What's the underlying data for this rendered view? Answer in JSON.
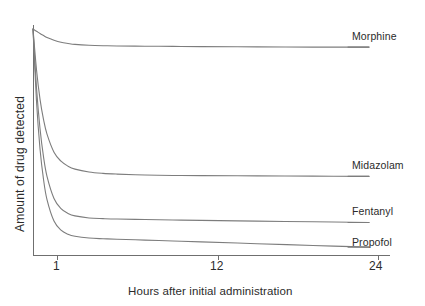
{
  "chart_data": {
    "type": "line",
    "title": "",
    "subtitle": "",
    "xlabel": "Hours after initial administration",
    "ylabel": "Amount of drug detected",
    "x_tick_labels": [
      "1",
      "12",
      "24"
    ],
    "x_tick_values": [
      1,
      12,
      24
    ],
    "y_tick_labels": [],
    "xlim": [
      0,
      25.5
    ],
    "ylim": [
      0,
      100
    ],
    "grid": false,
    "legend_position": "right-inline-end-of-line",
    "note": "Schematic pharmacokinetic decay curves; y-axis is unlabeled/relative amount of drug detected.",
    "series": [
      {
        "name": "Morphine",
        "color": "#7d7d7d",
        "plateau_value": 92,
        "x": [
          0.0,
          0.25,
          0.5,
          0.75,
          1.0,
          1.5,
          2.0,
          2.5,
          3.0,
          4.0,
          5.0,
          6.0,
          8.0,
          10.0,
          12.0,
          16.0,
          20.0,
          24.0
        ],
        "y": [
          100.0,
          99.0,
          98.0,
          97.1,
          96.2,
          95.0,
          94.1,
          93.6,
          93.2,
          92.8,
          92.6,
          92.5,
          92.4,
          92.3,
          92.2,
          92.1,
          92.0,
          92.0
        ]
      },
      {
        "name": "Midazolam",
        "color": "#7d7d7d",
        "plateau_value": 35,
        "x": [
          0.0,
          0.25,
          0.5,
          0.75,
          1.0,
          1.5,
          2.0,
          2.5,
          3.0,
          4.0,
          5.0,
          6.0,
          8.0,
          10.0,
          12.0,
          16.0,
          20.0,
          24.0
        ],
        "y": [
          100.0,
          82.0,
          69.0,
          60.0,
          53.5,
          45.5,
          41.5,
          39.3,
          38.0,
          36.7,
          36.1,
          35.8,
          35.4,
          35.2,
          35.1,
          35.0,
          34.9,
          34.8
        ]
      },
      {
        "name": "Fentanyl",
        "color": "#7d7d7d",
        "plateau_value": 15,
        "x": [
          0.0,
          0.25,
          0.5,
          0.75,
          1.0,
          1.5,
          2.0,
          2.5,
          3.0,
          4.0,
          5.0,
          6.0,
          8.0,
          10.0,
          12.0,
          16.0,
          20.0,
          24.0
        ],
        "y": [
          100.0,
          74.0,
          56.0,
          43.5,
          34.8,
          25.0,
          20.5,
          18.4,
          17.3,
          16.4,
          16.1,
          15.9,
          15.7,
          15.5,
          15.3,
          15.0,
          14.7,
          14.4
        ]
      },
      {
        "name": "Propofol",
        "color": "#7d7d7d",
        "plateau_value": 5,
        "x": [
          0.0,
          0.25,
          0.5,
          0.75,
          1.0,
          1.5,
          2.0,
          2.5,
          3.0,
          4.0,
          5.0,
          6.0,
          8.0,
          10.0,
          12.0,
          16.0,
          20.0,
          24.0
        ],
        "y": [
          100.0,
          68.0,
          47.0,
          33.5,
          24.5,
          15.0,
          11.0,
          9.2,
          8.3,
          7.5,
          7.2,
          7.0,
          6.6,
          6.2,
          5.8,
          5.0,
          4.2,
          3.5
        ]
      }
    ]
  },
  "labels": {
    "morphine": "Morphine",
    "midazolam": "Midazolam",
    "fentanyl": "Fentanyl",
    "propofol": "Propofol",
    "tick_1": "1",
    "tick_12": "12",
    "tick_24": "24",
    "x_axis_title": "Hours after initial administration",
    "y_axis_title": "Amount of drug detected"
  },
  "colors": {
    "curve": "#7d7d7d",
    "axis": "#6f6f6f",
    "text": "#2b2b2b",
    "background": "#ffffff"
  },
  "geometry": {
    "plot_left": 33,
    "plot_right": 390,
    "plot_top": 29,
    "plot_bottom": 255,
    "label_line_end": 348,
    "tick_x_1": 57,
    "tick_x_12": 218,
    "tick_x_24": 378
  }
}
